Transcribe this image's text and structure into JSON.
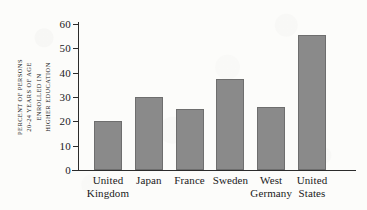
{
  "chart_data": {
    "type": "bar",
    "title": "",
    "subtitle": "",
    "xlabel": "",
    "ylabel": "PERCENT OF PERSONS 20-24 YEARS OF AGE ENROLLED IN HIGHER EDUCATION",
    "ylabel_lines": [
      "PERCENT OF PERSONS",
      "20-24 YEARS OF AGE",
      "ENROLLED IN",
      "HIGHER EDUCATION"
    ],
    "categories": [
      "United Kingdom",
      "Japan",
      "France",
      "Sweden",
      "West Germany",
      "United States"
    ],
    "category_lines": [
      [
        "United",
        "Kingdom"
      ],
      [
        "Japan",
        ""
      ],
      [
        "France",
        ""
      ],
      [
        "Sweden",
        ""
      ],
      [
        "West",
        "Germany"
      ],
      [
        "United",
        "States"
      ]
    ],
    "values": [
      20,
      30,
      25,
      37.5,
      26,
      55.5
    ],
    "ylim": [
      0,
      60
    ],
    "ytick_values": [
      0,
      10,
      20,
      30,
      40,
      50,
      60
    ],
    "ytick_labels": [
      "0",
      "10",
      "20",
      "30",
      "40",
      "50",
      "60"
    ],
    "grid": false,
    "legend": false,
    "legend_position": "none",
    "bar_color": "#8a8a8a",
    "bar_edge_color": "#6e6e6e",
    "axis_color": "#2b2b2b",
    "background_color": "#fcfcfa"
  }
}
